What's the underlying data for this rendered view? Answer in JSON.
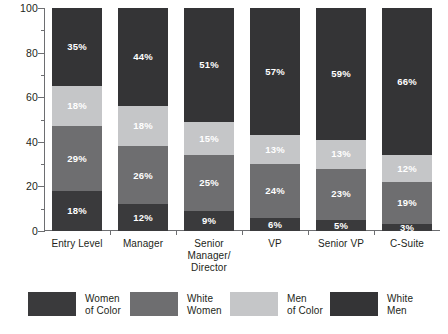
{
  "chart_data": {
    "type": "bar",
    "variant": "stacked-100",
    "title": "",
    "subtitle": "",
    "xlabel": "",
    "ylabel": "",
    "ylim": [
      0,
      100
    ],
    "yticks": [
      0,
      20,
      40,
      60,
      80,
      100
    ],
    "ytick_labels": [
      "0",
      "20",
      "40",
      "60",
      "80",
      "100"
    ],
    "y_minor_ticks": [
      10,
      30,
      50,
      70,
      90
    ],
    "grid": false,
    "legend_position": "bottom",
    "categories": [
      "Entry Level",
      "Manager",
      "Senior Manager/\nDirector",
      "VP",
      "Senior VP",
      "C-Suite"
    ],
    "series": [
      {
        "name": "Women of Color",
        "color": "#3a3a3c",
        "values": [
          18,
          12,
          9,
          6,
          5,
          3
        ],
        "labels": [
          "18%",
          "12%",
          "9%",
          "6%",
          "5%",
          "3%"
        ]
      },
      {
        "name": "White Women",
        "color": "#6e6e70",
        "values": [
          29,
          26,
          25,
          24,
          23,
          19
        ],
        "labels": [
          "29%",
          "26%",
          "25%",
          "24%",
          "23%",
          "19%"
        ]
      },
      {
        "name": "Men of Color",
        "color": "#c5c6c8",
        "values": [
          18,
          18,
          15,
          13,
          13,
          12
        ],
        "labels": [
          "18%",
          "18%",
          "15%",
          "13%",
          "13%",
          "12%"
        ]
      },
      {
        "name": "White Men",
        "color": "#343436",
        "values": [
          35,
          44,
          51,
          57,
          59,
          66
        ],
        "labels": [
          "35%",
          "44%",
          "51%",
          "57%",
          "59%",
          "66%"
        ]
      }
    ]
  },
  "legend": {
    "items": [
      {
        "label": "Women\nof Color",
        "color": "#3a3a3c"
      },
      {
        "label": "White\nWomen",
        "color": "#6e6e70"
      },
      {
        "label": "Men\nof Color",
        "color": "#c5c6c8"
      },
      {
        "label": "White\nMen",
        "color": "#343436"
      }
    ]
  },
  "axis": {
    "y_labels": [
      "100",
      "80",
      "60",
      "40",
      "20",
      "0"
    ]
  }
}
